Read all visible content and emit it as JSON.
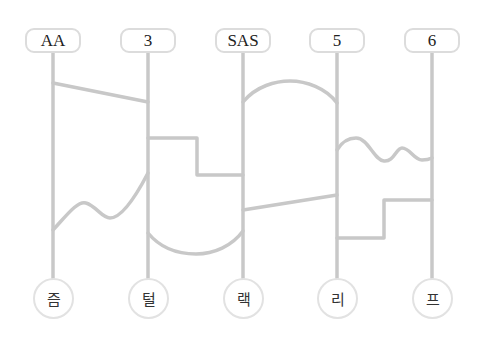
{
  "diagram": {
    "type": "ladder-game",
    "line_color": "#c8c8c8",
    "top_labels": [
      {
        "label": "AA",
        "x": 53
      },
      {
        "label": "3",
        "x": 148
      },
      {
        "label": "SAS",
        "x": 243
      },
      {
        "label": "5",
        "x": 337
      },
      {
        "label": "6",
        "x": 432
      }
    ],
    "bottom_labels": [
      {
        "label": "즘",
        "x": 53
      },
      {
        "label": "털",
        "x": 148
      },
      {
        "label": "랙",
        "x": 243
      },
      {
        "label": "리",
        "x": 337
      },
      {
        "label": "프",
        "x": 432
      }
    ],
    "rungs": [
      {
        "from": "AA",
        "to": "3",
        "shape": "diagonal-line"
      },
      {
        "from": "3",
        "to": "SAS",
        "shape": "step"
      },
      {
        "from": "AA",
        "to": "3",
        "shape": "wave"
      },
      {
        "from": "3",
        "to": "SAS",
        "shape": "u-arc"
      },
      {
        "from": "SAS",
        "to": "5",
        "shape": "arch"
      },
      {
        "from": "SAS",
        "to": "5",
        "shape": "diagonal-line"
      },
      {
        "from": "5",
        "to": "6",
        "shape": "wave"
      },
      {
        "from": "5",
        "to": "6",
        "shape": "step"
      }
    ]
  }
}
